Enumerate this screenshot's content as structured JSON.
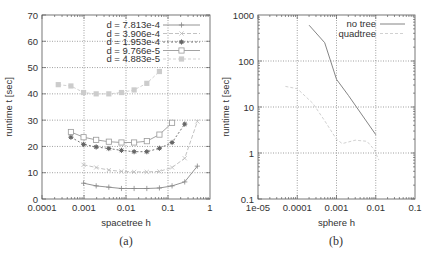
{
  "chart_data": [
    {
      "id": "a",
      "type": "line",
      "caption": "(a)",
      "xlabel": "spacetree h",
      "ylabel": "runtime t [sec]",
      "xscale": "log",
      "xlim": [
        0.0001,
        1
      ],
      "ylim": [
        0,
        70
      ],
      "xticks": [
        "0.0001",
        "0.001",
        "0.01",
        "0.1",
        "1"
      ],
      "yticks": [
        "0",
        "10",
        "20",
        "30",
        "40",
        "50",
        "60",
        "70"
      ],
      "grid": true,
      "legend_position": "top-right",
      "series": [
        {
          "name": "d = 7.813e-4",
          "marker": "plus",
          "color": "#888888",
          "dash": "",
          "x": [
            0.000977,
            0.00195,
            0.0039,
            0.0078,
            0.0156,
            0.0313,
            0.0625,
            0.125,
            0.25,
            0.5
          ],
          "y": [
            6,
            5,
            4.5,
            4,
            4,
            4,
            4.2,
            5,
            6.5,
            12.5
          ]
        },
        {
          "name": "d = 3.906e-4",
          "marker": "cross",
          "color": "#bbbbbb",
          "dash": "4,2",
          "x": [
            0.000977,
            0.00195,
            0.0039,
            0.0078,
            0.0156,
            0.0313,
            0.0625,
            0.125,
            0.25,
            0.5
          ],
          "y": [
            13,
            12,
            11,
            10.5,
            10.3,
            10.3,
            10.5,
            12,
            15.5,
            29.5
          ]
        },
        {
          "name": "d = 1.953e-4",
          "marker": "star",
          "color": "#666666",
          "dash": "2,2",
          "x": [
            0.000488,
            0.000977,
            0.00195,
            0.0039,
            0.0078,
            0.0156,
            0.0313,
            0.0625,
            0.125,
            0.25
          ],
          "y": [
            23.5,
            20.8,
            19.8,
            19.2,
            18.5,
            18,
            18,
            19.3,
            21.5,
            28.5
          ]
        },
        {
          "name": "d = 9.766e-5",
          "marker": "square",
          "color": "#999999",
          "dash": "",
          "x": [
            0.000488,
            0.000977,
            0.00195,
            0.0039,
            0.0078,
            0.0156,
            0.0313,
            0.0625,
            0.125
          ],
          "y": [
            25.5,
            23.5,
            22.5,
            21.8,
            21.5,
            21.5,
            22,
            24.5,
            29
          ]
        },
        {
          "name": "d = 4.883e-5",
          "marker": "filled-square",
          "color": "#cccccc",
          "dash": "3,2",
          "x": [
            0.000244,
            0.000488,
            0.000977,
            0.00195,
            0.0039,
            0.0078,
            0.0156,
            0.0313,
            0.0625
          ],
          "y": [
            43.5,
            43,
            40.5,
            40,
            40,
            40.5,
            41.5,
            44,
            48.5
          ]
        }
      ]
    },
    {
      "id": "b",
      "type": "line",
      "caption": "(b)",
      "xlabel": "sphere h",
      "ylabel": "runtime t [sec]",
      "xscale": "log",
      "yscale": "log",
      "xlim": [
        1e-05,
        0.1
      ],
      "ylim": [
        0.1,
        1000
      ],
      "xticks": [
        "1e-05",
        "0.0001",
        "0.001",
        "0.01",
        "0.1"
      ],
      "yticks": [
        "0.1",
        "1",
        "10",
        "100",
        "1000"
      ],
      "grid": true,
      "legend_position": "top-right",
      "series": [
        {
          "name": "no tree",
          "color": "#777777",
          "dash": "",
          "x": [
            0.0002,
            0.0005,
            0.001,
            0.002,
            0.01
          ],
          "y": [
            600,
            250,
            40,
            18,
            2.5
          ]
        },
        {
          "name": "quadtree",
          "color": "#cccccc",
          "dash": "3,2",
          "x": [
            5e-05,
            0.0001,
            0.00025,
            0.0005,
            0.001,
            0.0014,
            0.003,
            0.006,
            0.009,
            0.012
          ],
          "y": [
            28,
            25,
            12,
            5,
            2,
            1.6,
            1.9,
            1.8,
            1.2,
            0.7
          ]
        }
      ]
    }
  ]
}
